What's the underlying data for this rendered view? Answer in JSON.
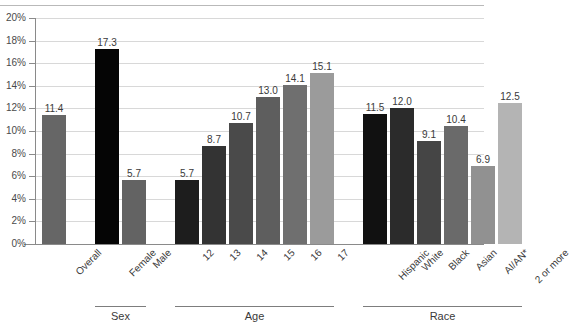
{
  "chart_data": {
    "type": "bar",
    "title": "",
    "xlabel": "",
    "ylabel": "",
    "ylim": [
      0,
      20
    ],
    "ytick_labels": [
      "0%",
      "2%",
      "4%",
      "6%",
      "8%",
      "10%",
      "12%",
      "14%",
      "16%",
      "18%",
      "20%"
    ],
    "ytick_values": [
      0,
      2,
      4,
      6,
      8,
      10,
      12,
      14,
      16,
      18,
      20
    ],
    "grid": true,
    "legend": "none",
    "value_label_format": "one-decimal",
    "categories": [
      "Overall",
      "Female",
      "Male",
      "12",
      "13",
      "14",
      "15",
      "16",
      "17",
      "Hispanic",
      "White",
      "Black",
      "Asian",
      "AI/AN*",
      "2 or more"
    ],
    "values": [
      11.4,
      17.3,
      5.7,
      5.7,
      8.7,
      10.7,
      13.0,
      14.1,
      15.1,
      11.5,
      12.0,
      9.1,
      10.4,
      6.9,
      12.5
    ],
    "groups": [
      {
        "label": "",
        "bars": [
          {
            "category": "Overall",
            "value": 11.4,
            "value_label": "11.4",
            "color": "#666666"
          }
        ]
      },
      {
        "label": "Sex",
        "bars": [
          {
            "category": "Female",
            "value": 17.3,
            "value_label": "17.3",
            "color": "#050505"
          },
          {
            "category": "Male",
            "value": 5.7,
            "value_label": "5.7",
            "color": "#636363"
          }
        ]
      },
      {
        "label": "Age",
        "bars": [
          {
            "category": "12",
            "value": 5.7,
            "value_label": "5.7",
            "color": "#1d1d1d"
          },
          {
            "category": "13",
            "value": 8.7,
            "value_label": "8.7",
            "color": "#333333"
          },
          {
            "category": "14",
            "value": 10.7,
            "value_label": "10.7",
            "color": "#4a4a4a"
          },
          {
            "category": "15",
            "value": 13.0,
            "value_label": "13.0",
            "color": "#5e5e5e"
          },
          {
            "category": "16",
            "value": 14.1,
            "value_label": "14.1",
            "color": "#6f6f6f"
          },
          {
            "category": "17",
            "value": 15.1,
            "value_label": "15.1",
            "color": "#9b9b9b"
          }
        ]
      },
      {
        "label": "Race",
        "bars": [
          {
            "category": "Hispanic",
            "value": 11.5,
            "value_label": "11.5",
            "color": "#111111"
          },
          {
            "category": "White",
            "value": 12.0,
            "value_label": "12.0",
            "color": "#2b2b2b"
          },
          {
            "category": "Black",
            "value": 9.1,
            "value_label": "9.1",
            "color": "#454545"
          },
          {
            "category": "Asian",
            "value": 10.4,
            "value_label": "10.4",
            "color": "#6a6a6a"
          },
          {
            "category": "AI/AN*",
            "value": 6.9,
            "value_label": "6.9",
            "color": "#919191"
          },
          {
            "category": "2 or more",
            "value": 12.5,
            "value_label": "12.5",
            "color": "#b4b4b4"
          }
        ]
      }
    ],
    "group_labels": [
      "Sex",
      "Age",
      "Race"
    ]
  },
  "axis": {
    "y_labels": [
      "20%",
      "18%",
      "16%",
      "14%",
      "12%",
      "10%",
      "8%",
      "6%",
      "4%",
      "2%",
      "0%"
    ]
  },
  "category_labels": {
    "overall": "Overall",
    "female": "Female",
    "male": "Male",
    "age12": "12",
    "age13": "13",
    "age14": "14",
    "age15": "15",
    "age16": "16",
    "age17": "17",
    "hispanic": "Hispanic",
    "white": "White",
    "black": "Black",
    "asian": "Asian",
    "aian": "AI/AN*",
    "two_or_more": "2 or more"
  },
  "group_labels": {
    "sex": "Sex",
    "age": "Age",
    "race": "Race"
  },
  "value_labels": {
    "overall": "11.4",
    "female": "17.3",
    "male": "5.7",
    "age12": "5.7",
    "age13": "8.7",
    "age14": "10.7",
    "age15": "13.0",
    "age16": "14.1",
    "age17": "15.1",
    "hispanic": "11.5",
    "white": "12.0",
    "black": "9.1",
    "asian": "10.4",
    "aian": "6.9",
    "two_or_more": "12.5"
  }
}
